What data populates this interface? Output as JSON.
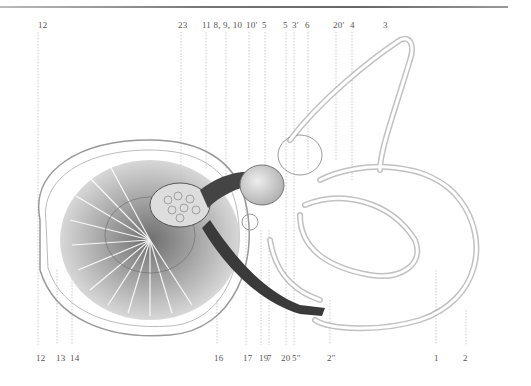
{
  "figure": {
    "top_labels": [
      {
        "text": "12",
        "x": 38
      },
      {
        "text": "23",
        "x": 178
      },
      {
        "text": "11 8, 9, 10",
        "x": 202
      },
      {
        "text": "10′",
        "x": 246
      },
      {
        "text": "5",
        "x": 262
      },
      {
        "text": "5",
        "x": 283
      },
      {
        "text": "3′",
        "x": 292
      },
      {
        "text": "6",
        "x": 305
      },
      {
        "text": "20′",
        "x": 333
      },
      {
        "text": "4",
        "x": 350
      },
      {
        "text": "3",
        "x": 383
      }
    ],
    "bottom_labels": [
      {
        "text": "12",
        "x": 36
      },
      {
        "text": "13",
        "x": 56
      },
      {
        "text": "14",
        "x": 70
      },
      {
        "text": "16",
        "x": 214
      },
      {
        "text": "17",
        "x": 243
      },
      {
        "text": "19",
        "x": 259
      },
      {
        "text": "7",
        "x": 267
      },
      {
        "text": "20",
        "x": 281
      },
      {
        "text": "5″",
        "x": 292
      },
      {
        "text": "2″",
        "x": 327
      },
      {
        "text": "1",
        "x": 434
      },
      {
        "text": "2",
        "x": 463
      }
    ]
  },
  "colors": {
    "ink": "#444444",
    "light_ink": "#999999",
    "paper": "#ffffff",
    "nerve": "#333333"
  }
}
